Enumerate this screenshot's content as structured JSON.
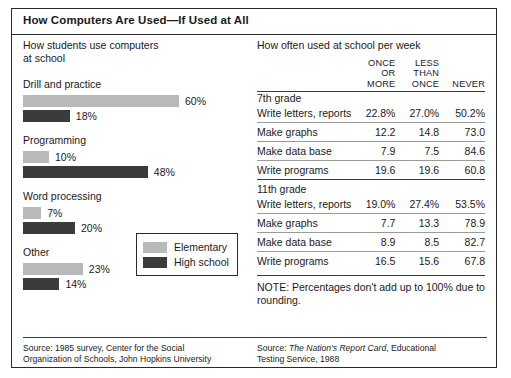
{
  "title": "How Computers Are Used—If Used at All",
  "left": {
    "heading": "How students use computers\nat school",
    "legend": {
      "elementary": "Elementary",
      "high_school": "High school"
    },
    "source": "Source: 1985 survey, Center for the Social\nOrganization of Schools, John Hopkins University"
  },
  "right": {
    "heading": "How often used at school per week",
    "columns": [
      "",
      "ONCE\nOR MORE",
      "LESS\nTHAN\nONCE",
      "NEVER"
    ],
    "groups": [
      {
        "name": "7th grade",
        "rows": [
          {
            "item": "Write letters, reports",
            "once_or_more": "22.8%",
            "less_than_once": "27.0%",
            "never": "50.2%"
          },
          {
            "item": "Make graphs",
            "once_or_more": "12.2",
            "less_than_once": "14.8",
            "never": "73.0"
          },
          {
            "item": "Make data base",
            "once_or_more": "7.9",
            "less_than_once": "7.5",
            "never": "84.6"
          },
          {
            "item": "Write programs",
            "once_or_more": "19.6",
            "less_than_once": "19.6",
            "never": "60.8"
          }
        ]
      },
      {
        "name": "11th grade",
        "rows": [
          {
            "item": "Write letters, reports",
            "once_or_more": "19.0%",
            "less_than_once": "27.4%",
            "never": "53.5%"
          },
          {
            "item": "Make graphs",
            "once_or_more": "7.7",
            "less_than_once": "13.3",
            "never": "78.9"
          },
          {
            "item": "Make data base",
            "once_or_more": "8.9",
            "less_than_once": "8.5",
            "never": "82.7"
          },
          {
            "item": "Write programs",
            "once_or_more": "16.5",
            "less_than_once": "15.6",
            "never": "67.8"
          }
        ]
      }
    ],
    "note": "NOTE: Percentages don't add up to 100% due to rounding.",
    "source_prefix": "Source: ",
    "source_italic": "The Nation's Report Card",
    "source_suffix": ", Educational\nTesting Service, 1988"
  },
  "colors": {
    "elementary": "#b9b9b9",
    "high_school": "#3b3b3b",
    "border": "#2a2a2a",
    "background": "#ffffff"
  },
  "chart_data": {
    "type": "bar",
    "title": "How students use computers at school",
    "orientation": "horizontal",
    "xlabel": "",
    "ylabel": "",
    "xlim": [
      0,
      60
    ],
    "grid": false,
    "legend_position": "inside-bottom-right",
    "value_suffix": "%",
    "categories": [
      "Drill and practice",
      "Programming",
      "Word processing",
      "Other"
    ],
    "series": [
      {
        "name": "Elementary",
        "color": "#b9b9b9",
        "values": [
          60,
          10,
          7,
          23
        ],
        "labels": [
          "60%",
          "10%",
          "7%",
          "23%"
        ]
      },
      {
        "name": "High school",
        "color": "#3b3b3b",
        "values": [
          18,
          48,
          20,
          14
        ],
        "labels": [
          "18%",
          "48%",
          "20%",
          "14%"
        ]
      }
    ],
    "px_per_unit": 2.6
  }
}
